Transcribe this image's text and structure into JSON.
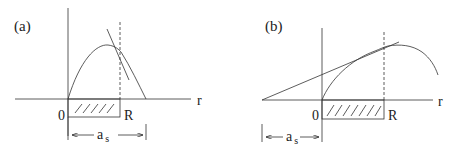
{
  "panels": [
    {
      "id": "a",
      "label": "(a)",
      "axis_label": "r",
      "origin_label": "0",
      "boundary_label": "R",
      "span_label_main": "a",
      "span_label_sub": "s"
    },
    {
      "id": "b",
      "label": "(b)",
      "axis_label": "r",
      "origin_label": "0",
      "boundary_label": "R",
      "span_label_main": "a",
      "span_label_sub": "s"
    }
  ],
  "colors": {
    "stroke": "#333333",
    "background": "#ffffff"
  }
}
